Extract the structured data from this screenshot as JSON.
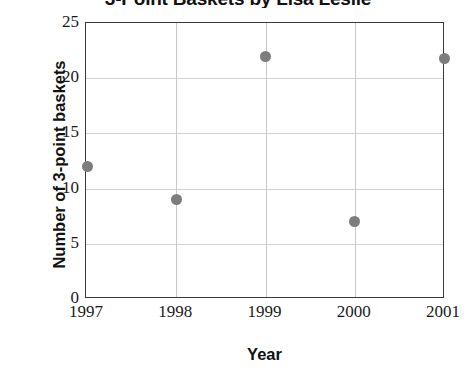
{
  "chart_data": {
    "type": "scatter",
    "title": "3-Point Baskets by Lisa Leslie",
    "xlabel": "Year",
    "ylabel": "Number of 3-point baskets",
    "categories": [
      "1997",
      "1998",
      "1999",
      "2000",
      "2001"
    ],
    "x": [
      1997,
      1998,
      1999,
      2000,
      2001
    ],
    "values": [
      12,
      9,
      22,
      7,
      21.8
    ],
    "points": [
      {
        "x": "1997",
        "y": 12
      },
      {
        "x": "1998",
        "y": 9
      },
      {
        "x": "1999",
        "y": 22
      },
      {
        "x": "2000",
        "y": 7
      },
      {
        "x": "2001",
        "y": 21.8
      }
    ],
    "ylim": [
      0,
      25
    ],
    "yticks": [
      0,
      5,
      10,
      15,
      20,
      25
    ],
    "ytick_labels": [
      "0",
      "5",
      "10",
      "15",
      "20",
      "25"
    ],
    "xtick_labels": [
      "1997",
      "1998",
      "1999",
      "2000",
      "2001"
    ],
    "grid": true,
    "legend": false,
    "marker_color": "#7d7d7d",
    "axis_color": "#3a3a3a",
    "grid_color": "#d2d2d2",
    "text_color": "#111111"
  }
}
